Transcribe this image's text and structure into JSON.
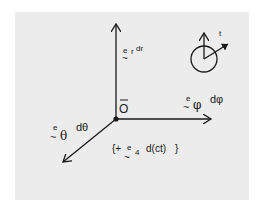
{
  "diagram": {
    "title": "",
    "colors": {
      "background": "#ececec",
      "ink": "#1a1a1a",
      "page": "#ffffff"
    },
    "origin": {
      "label": "O",
      "overline": true
    },
    "axes": [
      {
        "id": "r",
        "direction": "up",
        "basis": "e",
        "subscript": "r",
        "differential": "dr"
      },
      {
        "id": "phi",
        "direction": "right",
        "basis": "e",
        "subscript": "φ",
        "differential": "dφ"
      },
      {
        "id": "theta",
        "direction": "down-left",
        "basis": "e",
        "subscript": "θ",
        "differential": "dθ"
      }
    ],
    "extra_term": {
      "prefix": "{+",
      "basis": "e",
      "subscript": "4",
      "differential": "d(ct)",
      "suffix": "}"
    },
    "time_icon": {
      "label": "t"
    },
    "tilde": "~"
  }
}
